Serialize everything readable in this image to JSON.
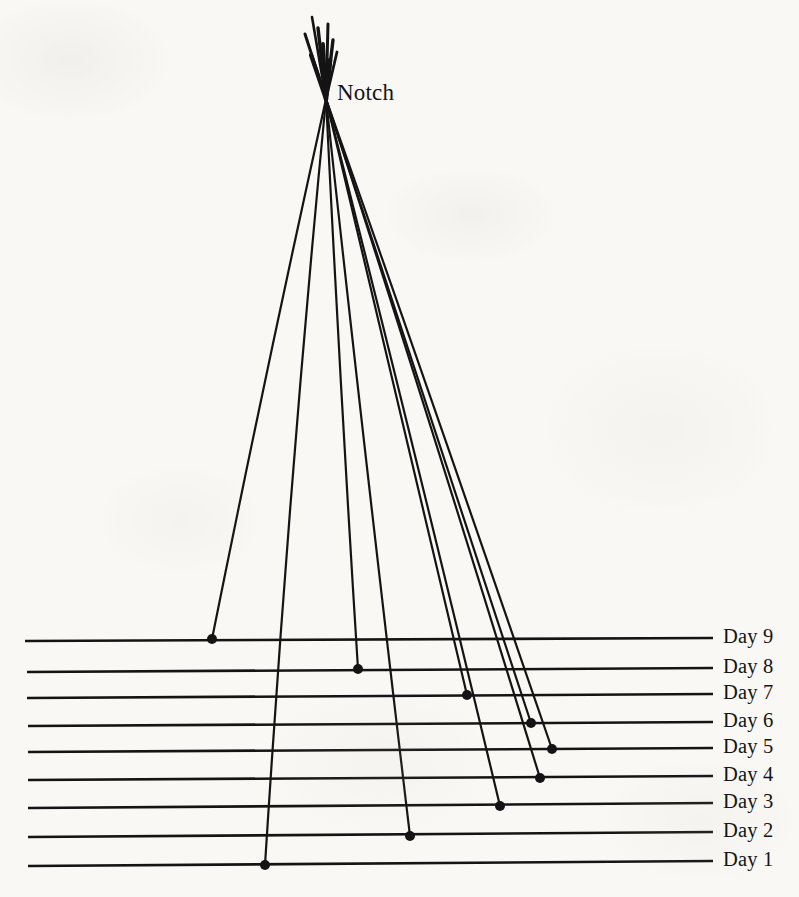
{
  "figure": {
    "background_color": "#f9f8f5",
    "ink_color": "#141414",
    "notch": {
      "label": "Notch",
      "label_x": 337,
      "label_y": 98,
      "apex_x": 326,
      "apex_y": 99
    }
  },
  "chart_data": {
    "type": "line",
    "title": "Notch",
    "xlabel": "",
    "ylabel": "",
    "grid": true,
    "legend_position": "right",
    "origin": {
      "x": 326,
      "y": 99
    },
    "categories": [
      "Day 1",
      "Day 2",
      "Day 3",
      "Day 4",
      "Day 5",
      "Day 6",
      "Day 7",
      "Day 8",
      "Day 9"
    ],
    "baselines": [
      {
        "label": "Day 9",
        "y_left": 641,
        "y_right": 638,
        "x_left": 25,
        "x_right": 713,
        "label_x": 723,
        "label_y": 639
      },
      {
        "label": "Day 8",
        "y_left": 672,
        "y_right": 668,
        "x_left": 27,
        "x_right": 713,
        "label_x": 723,
        "label_y": 669
      },
      {
        "label": "Day 7",
        "y_left": 698,
        "y_right": 694,
        "x_left": 27,
        "x_right": 713,
        "label_x": 723,
        "label_y": 695
      },
      {
        "label": "Day 6",
        "y_left": 726,
        "y_right": 722,
        "x_left": 28,
        "x_right": 713,
        "label_x": 723,
        "label_y": 723
      },
      {
        "label": "Day 5",
        "y_left": 752,
        "y_right": 748,
        "x_left": 28,
        "x_right": 713,
        "label_x": 723,
        "label_y": 749
      },
      {
        "label": "Day 4",
        "y_left": 780,
        "y_right": 776,
        "x_left": 28,
        "x_right": 713,
        "label_x": 723,
        "label_y": 777
      },
      {
        "label": "Day 3",
        "y_left": 808,
        "y_right": 803,
        "x_left": 28,
        "x_right": 713,
        "label_x": 723,
        "label_y": 804
      },
      {
        "label": "Day 2",
        "y_left": 837,
        "y_right": 832,
        "x_left": 28,
        "x_right": 713,
        "label_x": 723,
        "label_y": 833
      },
      {
        "label": "Day 1",
        "y_left": 866,
        "y_right": 861,
        "x_left": 28,
        "x_right": 713,
        "label_x": 723,
        "label_y": 862
      }
    ],
    "rays": [
      {
        "name": "Day 9 ray",
        "day": "Day 9",
        "endpoint_x": 212,
        "endpoint_y": 639,
        "mid_x": 266,
        "mid_y": 370
      },
      {
        "name": "Day 8 ray",
        "day": "Day 8",
        "endpoint_x": 358,
        "endpoint_y": 669,
        "mid_x": 340,
        "mid_y": 385
      },
      {
        "name": "Day 7 ray",
        "day": "Day 7",
        "endpoint_x": 467,
        "endpoint_y": 695,
        "mid_x": 394,
        "mid_y": 392
      },
      {
        "name": "Day 6 ray",
        "day": "Day 6",
        "endpoint_x": 531,
        "endpoint_y": 723,
        "mid_x": 425,
        "mid_y": 400
      },
      {
        "name": "Day 5 ray",
        "day": "Day 5",
        "endpoint_x": 552,
        "endpoint_y": 749,
        "mid_x": 435,
        "mid_y": 408
      },
      {
        "name": "Day 4 ray",
        "day": "Day 4",
        "endpoint_x": 540,
        "endpoint_y": 778,
        "mid_x": 430,
        "mid_y": 420
      },
      {
        "name": "Day 3 ray",
        "day": "Day 3",
        "endpoint_x": 500,
        "endpoint_y": 806,
        "mid_x": 410,
        "mid_y": 430
      },
      {
        "name": "Day 2 ray",
        "day": "Day 2",
        "endpoint_x": 410,
        "endpoint_y": 836,
        "mid_x": 364,
        "mid_y": 450
      },
      {
        "name": "Day 1 ray",
        "day": "Day 1",
        "endpoint_x": 265,
        "endpoint_y": 865,
        "mid_x": 290,
        "mid_y": 470
      }
    ],
    "notch_stubs": [
      {
        "x1": 326,
        "y1": 99,
        "x2": 305,
        "y2": 34,
        "width": 3.0
      },
      {
        "x1": 326,
        "y1": 99,
        "x2": 312,
        "y2": 17,
        "width": 2.6
      },
      {
        "x1": 326,
        "y1": 99,
        "x2": 318,
        "y2": 28,
        "width": 3.4
      },
      {
        "x1": 326,
        "y1": 99,
        "x2": 323,
        "y2": 44,
        "width": 3.8
      },
      {
        "x1": 326,
        "y1": 99,
        "x2": 328,
        "y2": 24,
        "width": 3.0
      },
      {
        "x1": 326,
        "y1": 99,
        "x2": 333,
        "y2": 40,
        "width": 3.4
      },
      {
        "x1": 326,
        "y1": 99,
        "x2": 337,
        "y2": 52,
        "width": 2.8
      },
      {
        "x1": 326,
        "y1": 99,
        "x2": 311,
        "y2": 55,
        "width": 4.2
      },
      {
        "x1": 326,
        "y1": 99,
        "x2": 330,
        "y2": 60,
        "width": 4.6
      }
    ],
    "dot_radius": 5
  }
}
